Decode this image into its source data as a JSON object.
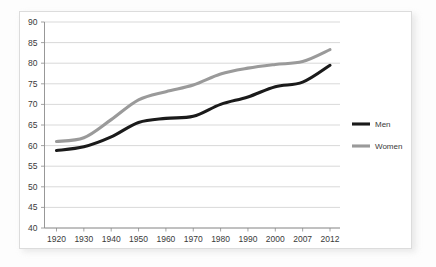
{
  "chart_data": {
    "type": "line",
    "title": "",
    "subtitle": "",
    "xlabel": "",
    "ylabel": "",
    "categories": [
      "1920",
      "1930",
      "1940",
      "1950",
      "1960",
      "1970",
      "1980",
      "1990",
      "2000",
      "2007",
      "2012"
    ],
    "ylim": [
      40,
      90
    ],
    "yticks": [
      "40",
      "45",
      "50",
      "55",
      "60",
      "65",
      "70",
      "75",
      "80",
      "85",
      "90"
    ],
    "ytick_step": 5,
    "grid": true,
    "grid_axis": "y",
    "legend_position": "right",
    "series": [
      {
        "name": "Men",
        "color": "#1a1a1a",
        "values": [
          58.8,
          59.7,
          62.1,
          65.6,
          66.6,
          67.1,
          70.0,
          71.8,
          74.3,
          75.4,
          79.5
        ]
      },
      {
        "name": "Women",
        "color": "#9a9a9a",
        "values": [
          61.0,
          61.9,
          66.3,
          71.1,
          73.1,
          74.7,
          77.4,
          78.8,
          79.7,
          80.4,
          83.3
        ]
      }
    ]
  },
  "legend": {
    "items": [
      {
        "label": "Men",
        "color": "#1a1a1a"
      },
      {
        "label": "Women",
        "color": "#9a9a9a"
      }
    ]
  },
  "colors": {
    "men": "#1a1a1a",
    "women": "#9a9a9a",
    "grid": "#c9c9c9",
    "axis": "#8c8c8c",
    "text": "#3a3a3a",
    "card_background": "#ffffff",
    "page_background": "#fdfdfd"
  }
}
